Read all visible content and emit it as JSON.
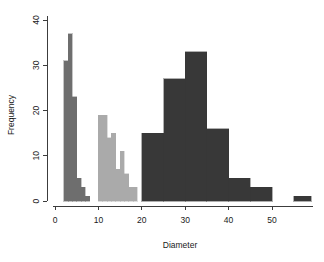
{
  "chart_data": {
    "type": "bar",
    "title": "",
    "xlabel": "Diameter",
    "ylabel": "Frequency",
    "xlim": [
      0,
      60
    ],
    "ylim": [
      0,
      41
    ],
    "xticks": [
      0,
      10,
      20,
      30,
      40,
      50
    ],
    "yticks": [
      0,
      10,
      20,
      30,
      40
    ],
    "grid": false,
    "legend": "none",
    "series": [
      {
        "name": "group-1",
        "color": "#6e6e6e",
        "binwidth": 1,
        "bins": [
          {
            "x0": 2,
            "x1": 3,
            "value": 31
          },
          {
            "x0": 3,
            "x1": 4,
            "value": 37
          },
          {
            "x0": 4,
            "x1": 5,
            "value": 23
          },
          {
            "x0": 5,
            "x1": 6,
            "value": 5
          },
          {
            "x0": 6,
            "x1": 7,
            "value": 3
          },
          {
            "x0": 7,
            "x1": 8,
            "value": 1
          }
        ]
      },
      {
        "name": "group-2",
        "color": "#aaaaaa",
        "binwidth": 1,
        "bins": [
          {
            "x0": 10,
            "x1": 11,
            "value": 19
          },
          {
            "x0": 11,
            "x1": 12,
            "value": 19
          },
          {
            "x0": 12,
            "x1": 13,
            "value": 14
          },
          {
            "x0": 13,
            "x1": 14,
            "value": 15
          },
          {
            "x0": 14,
            "x1": 15,
            "value": 7
          },
          {
            "x0": 15,
            "x1": 16,
            "value": 11
          },
          {
            "x0": 16,
            "x1": 17,
            "value": 6
          },
          {
            "x0": 17,
            "x1": 18,
            "value": 3
          },
          {
            "x0": 18,
            "x1": 19,
            "value": 3
          }
        ]
      },
      {
        "name": "group-3",
        "color": "#383838",
        "binwidth": 5,
        "bins": [
          {
            "x0": 20,
            "x1": 25,
            "value": 15
          },
          {
            "x0": 25,
            "x1": 30,
            "value": 27
          },
          {
            "x0": 30,
            "x1": 35,
            "value": 33
          },
          {
            "x0": 35,
            "x1": 40,
            "value": 16
          },
          {
            "x0": 40,
            "x1": 45,
            "value": 5
          },
          {
            "x0": 45,
            "x1": 50,
            "value": 3
          },
          {
            "x0": 50,
            "x1": 55,
            "value": 0
          },
          {
            "x0": 55,
            "x1": 59,
            "value": 1
          }
        ]
      }
    ]
  },
  "axes": {
    "x_tick_labels": [
      "0",
      "10",
      "20",
      "30",
      "40",
      "50"
    ],
    "y_tick_labels": [
      "0",
      "10",
      "20",
      "30",
      "40"
    ],
    "x_title": "Diameter",
    "y_title": "Frequency"
  }
}
